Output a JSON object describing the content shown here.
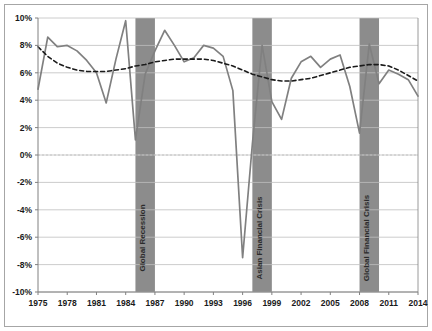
{
  "chart_data": {
    "type": "line",
    "title": "",
    "subtitle": "",
    "xlabel": "",
    "ylabel": "",
    "grid": true,
    "legend_position": "none",
    "xlim": [
      1975,
      2014
    ],
    "ylim": [
      -10,
      10
    ],
    "ytick_labels": [
      "10%",
      "8%",
      "6%",
      "4%",
      "2%",
      "0%",
      "-2%",
      "-4%",
      "-6%",
      "-8%",
      "-10%"
    ],
    "ytick_values": [
      10,
      8,
      6,
      4,
      2,
      0,
      -2,
      -4,
      -6,
      -8,
      -10
    ],
    "xtick_labels": [
      "1975",
      "1978",
      "1981",
      "1984",
      "1987",
      "1990",
      "1993",
      "1996",
      "1999",
      "2002",
      "2005",
      "2008",
      "2011",
      "2014"
    ],
    "xtick_values": [
      1975,
      1978,
      1981,
      1984,
      1987,
      1990,
      1993,
      1996,
      1999,
      2002,
      2005,
      2008,
      2011,
      2014
    ],
    "x": [
      1975,
      1976,
      1977,
      1978,
      1979,
      1980,
      1981,
      1982,
      1983,
      1984,
      1985,
      1986,
      1987,
      1988,
      1989,
      1990,
      1991,
      1992,
      1993,
      1994,
      1995,
      1996,
      1997,
      1998,
      1999,
      2000,
      2001,
      2002,
      2003,
      2004,
      2005,
      2006,
      2007,
      2008,
      2009,
      2010,
      2011,
      2012,
      2013,
      2014
    ],
    "series": [
      {
        "name": "Annual growth rate",
        "style": "solid",
        "color": "#808080",
        "values": [
          4.8,
          8.6,
          7.9,
          8.0,
          7.6,
          6.9,
          6.0,
          3.8,
          7.0,
          9.8,
          1.1,
          5.9,
          7.6,
          9.1,
          8.0,
          6.8,
          7.1,
          8.0,
          7.8,
          7.2,
          4.7,
          -7.5,
          0.8,
          8.0,
          3.9,
          2.6,
          5.6,
          6.8,
          7.2,
          6.4,
          7.0,
          7.3,
          5.0,
          1.6,
          8.1,
          5.2,
          6.2,
          5.9,
          5.5,
          4.3
        ]
      },
      {
        "name": "Trend (polynomial)",
        "style": "dashed",
        "color": "#1a1a1a",
        "values": [
          7.9,
          7.2,
          6.7,
          6.4,
          6.2,
          6.1,
          6.1,
          6.1,
          6.2,
          6.3,
          6.5,
          6.6,
          6.8,
          6.9,
          7.0,
          7.0,
          7.0,
          7.0,
          6.9,
          6.7,
          6.5,
          6.2,
          5.9,
          5.7,
          5.5,
          5.4,
          5.4,
          5.5,
          5.6,
          5.8,
          6.0,
          6.2,
          6.4,
          6.5,
          6.6,
          6.6,
          6.5,
          6.2,
          5.8,
          5.4
        ]
      }
    ],
    "shaded_bands": [
      {
        "label": "Global Recession",
        "start": 1985,
        "end": 1986,
        "color": "#8c8c8c"
      },
      {
        "label": "Asian Financial Crisis",
        "start": 1997,
        "end": 1998,
        "color": "#8c8c8c"
      },
      {
        "label": "Global Financial Crisis",
        "start": 2008,
        "end": 2009,
        "color": "#8c8c8c"
      }
    ],
    "colors": {
      "plot_background": "#ffffff",
      "gridline": "#bfbfbf",
      "axis": "#808080",
      "frame_border": "#a6a6a6",
      "band_fill": "#8c8c8c",
      "series_line": "#808080",
      "trend_line": "#1a1a1a",
      "tick_text": "#1a1a1a"
    }
  }
}
